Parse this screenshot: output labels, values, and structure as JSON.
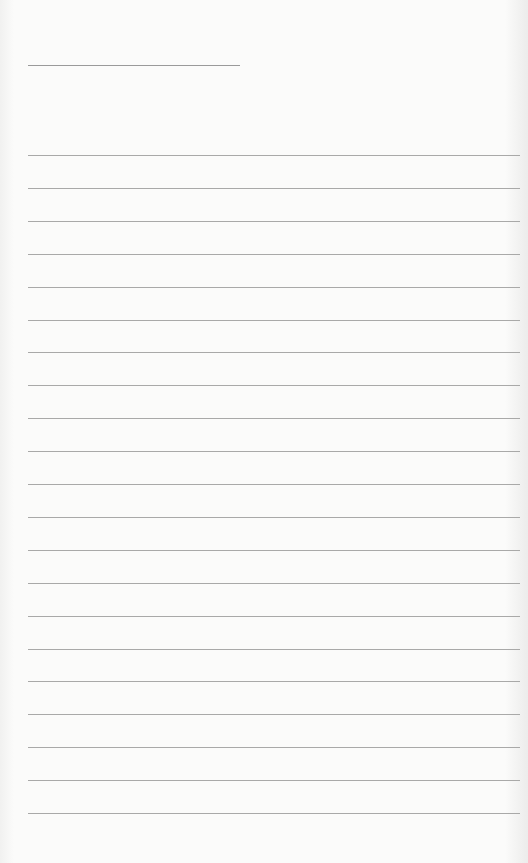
{
  "page": {
    "type": "blank lined sheet",
    "title_line": {
      "x": 28,
      "y": 65,
      "width": 212
    },
    "rules": {
      "count": 21,
      "start_y": 155,
      "spacing": 32.9,
      "x": 28,
      "width": 492
    },
    "colors": {
      "paper": "#fbfbfa",
      "rule": "#a9a9a8",
      "title_line": "#9a9a9a"
    }
  }
}
